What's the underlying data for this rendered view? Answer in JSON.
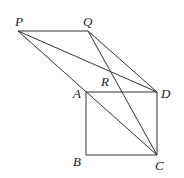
{
  "diagram": {
    "points": {
      "P": {
        "label": "P",
        "x": 18,
        "y": 31,
        "lx": 15,
        "ly": 26
      },
      "Q": {
        "label": "Q",
        "x": 88,
        "y": 31,
        "lx": 83,
        "ly": 26
      },
      "R": {
        "label": "R",
        "x": 110,
        "y": 72,
        "lx": 101,
        "ly": 86
      },
      "A": {
        "label": "A",
        "x": 86,
        "y": 92,
        "lx": 73,
        "ly": 98
      },
      "D": {
        "label": "D",
        "x": 157,
        "y": 92,
        "lx": 161,
        "ly": 98
      },
      "B": {
        "label": "B",
        "x": 86,
        "y": 155,
        "lx": 73,
        "ly": 166
      },
      "C": {
        "label": "C",
        "x": 157,
        "y": 155,
        "lx": 155,
        "ly": 170
      }
    },
    "segments": [
      [
        "P",
        "Q"
      ],
      [
        "P",
        "D"
      ],
      [
        "P",
        "C"
      ],
      [
        "Q",
        "D"
      ],
      [
        "Q",
        "C"
      ],
      [
        "A",
        "D"
      ],
      [
        "A",
        "B"
      ],
      [
        "B",
        "C"
      ],
      [
        "D",
        "C"
      ]
    ]
  }
}
